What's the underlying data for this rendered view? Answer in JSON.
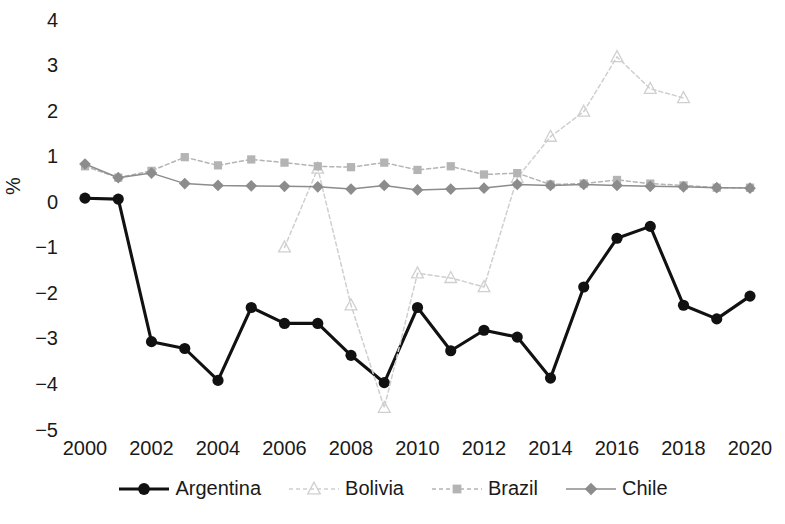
{
  "chart_data": {
    "type": "line",
    "title": "",
    "subtitle": "",
    "xlabel": "",
    "ylabel": "%",
    "xlim": [
      2000,
      2020
    ],
    "ylim": [
      -5,
      4
    ],
    "x": [
      2000,
      2001,
      2002,
      2003,
      2004,
      2005,
      2006,
      2007,
      2008,
      2009,
      2010,
      2011,
      2012,
      2013,
      2014,
      2015,
      2016,
      2017,
      2018,
      2019,
      2020
    ],
    "xticks": [
      "2000",
      "2002",
      "2004",
      "2006",
      "2008",
      "2010",
      "2012",
      "2014",
      "2016",
      "2018",
      "2020"
    ],
    "yticks": [
      "4",
      "3",
      "2",
      "1",
      "0",
      "-1",
      "-2",
      "-3",
      "-4",
      "-5"
    ],
    "grid": false,
    "legend_position": "bottom",
    "series": [
      {
        "name": "Argentina",
        "color": "#111111",
        "marker": "circle",
        "linestyle": "solid",
        "x": [
          2000,
          2001,
          2002,
          2003,
          2004,
          2005,
          2006,
          2007,
          2008,
          2009,
          2010,
          2011,
          2012,
          2013,
          2014,
          2015,
          2016,
          2017,
          2018,
          2019,
          2020
        ],
        "values": [
          0.1,
          0.08,
          -3.05,
          -3.2,
          -3.9,
          -2.3,
          -2.65,
          -2.65,
          -3.35,
          -3.95,
          -2.3,
          -3.25,
          -2.8,
          -2.95,
          -3.85,
          -1.85,
          -0.78,
          -0.52,
          -2.25,
          -2.55,
          -2.05
        ]
      },
      {
        "name": "Bolivia",
        "color": "#cfcfcf",
        "marker": "triangle",
        "linestyle": "dashed",
        "x": [
          2006,
          2007,
          2008,
          2009,
          2010,
          2011,
          2012,
          2013,
          2014,
          2015,
          2016,
          2017,
          2018
        ],
        "values": [
          -0.98,
          0.75,
          -2.25,
          -4.5,
          -1.55,
          -1.65,
          -1.85,
          0.55,
          1.45,
          2.0,
          3.2,
          2.5,
          2.3
        ]
      },
      {
        "name": "Brazil",
        "color": "#b4b4b4",
        "marker": "square",
        "linestyle": "dashed",
        "x": [
          2000,
          2001,
          2002,
          2003,
          2004,
          2005,
          2006,
          2007,
          2008,
          2009,
          2010,
          2011,
          2012,
          2013,
          2014,
          2015,
          2016,
          2017,
          2018,
          2019,
          2020
        ],
        "values": [
          0.8,
          0.55,
          0.7,
          1.0,
          0.82,
          0.95,
          0.88,
          0.8,
          0.78,
          0.88,
          0.72,
          0.8,
          0.62,
          0.65,
          0.4,
          0.42,
          0.5,
          0.42,
          0.38,
          0.33,
          0.33
        ]
      },
      {
        "name": "Chile",
        "color": "#8c8c8c",
        "marker": "diamond",
        "linestyle": "solid",
        "x": [
          2000,
          2001,
          2002,
          2003,
          2004,
          2005,
          2006,
          2007,
          2008,
          2009,
          2010,
          2011,
          2012,
          2013,
          2014,
          2015,
          2016,
          2017,
          2018,
          2019,
          2020
        ],
        "values": [
          0.85,
          0.55,
          0.65,
          0.42,
          0.38,
          0.37,
          0.36,
          0.35,
          0.3,
          0.38,
          0.28,
          0.3,
          0.32,
          0.4,
          0.38,
          0.4,
          0.38,
          0.36,
          0.35,
          0.33,
          0.32
        ]
      }
    ]
  },
  "legend": {
    "items": [
      {
        "label": "Argentina"
      },
      {
        "label": "Bolivia"
      },
      {
        "label": "Brazil"
      },
      {
        "label": "Chile"
      }
    ]
  }
}
